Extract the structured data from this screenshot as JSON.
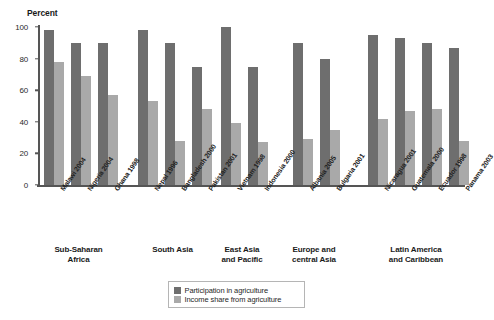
{
  "chart_data": {
    "type": "bar",
    "title": "",
    "ylabel": "Percent",
    "xlabel": "",
    "ylim": [
      0,
      100
    ],
    "yticks": [
      "0",
      "20",
      "40",
      "60",
      "80",
      "100"
    ],
    "grid": false,
    "legend_position": "bottom-center",
    "colors": {
      "participation": "#6e6e6e",
      "income_share": "#a9a9a9",
      "axis": "#555555",
      "text": "#1a1a1a",
      "background": "#ffffff"
    },
    "series": [
      {
        "name": "Participation in agriculture",
        "color": "#6e6e6e",
        "values": [
          98,
          90,
          90,
          98,
          90,
          75,
          100,
          75,
          90,
          80,
          95,
          93,
          90,
          87
        ]
      },
      {
        "name": "Income share from agriculture",
        "color": "#a9a9a9",
        "values": [
          78,
          69,
          57,
          53,
          28,
          48,
          39,
          27,
          29,
          35,
          42,
          47,
          48,
          28
        ]
      }
    ],
    "categories": [
      "Malawi 2004",
      "Nigeria 2004",
      "Ghana 1998",
      "Nepal 1996",
      "Bangladesh 2000",
      "Pakistan 2001",
      "Vietnam 1998",
      "Indonesia 2000",
      "Albania 2005",
      "Bulgaria 2001",
      "Nicaragua 2001",
      "Guatemala 2000",
      "Ecuador 1998",
      "Panama 2003"
    ],
    "groups": [
      {
        "label_line1": "Sub-Saharan",
        "label_line2": "Africa",
        "count": 3
      },
      {
        "label_line1": "South Asia",
        "label_line2": "",
        "count": 3
      },
      {
        "label_line1": "East Asia",
        "label_line2": "and Pacific",
        "count": 2
      },
      {
        "label_line1": "Europe and",
        "label_line2": "central Asia",
        "count": 2
      },
      {
        "label_line1": "Latin America",
        "label_line2": "and Caribbean",
        "count": 4
      }
    ]
  },
  "legend": {
    "items": [
      {
        "label": "Participation in agriculture",
        "color": "#6e6e6e"
      },
      {
        "label": "Income share from agriculture",
        "color": "#a9a9a9"
      }
    ]
  }
}
